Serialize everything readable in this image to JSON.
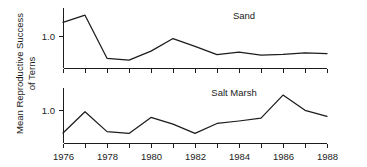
{
  "chart_data": {
    "type": "line",
    "title": "",
    "xlabel": "",
    "ylabel": "Mean Reproductive Success of Terns",
    "ylabel_line1": "Mean Reproductive Success",
    "ylabel_line2": "of Terns",
    "x": [
      1976,
      1977,
      1978,
      1979,
      1980,
      1981,
      1982,
      1983,
      1984,
      1985,
      1986,
      1987,
      1988
    ],
    "xlim": [
      1976,
      1988
    ],
    "xticks_major": [
      1976,
      1978,
      1980,
      1982,
      1984,
      1986,
      1988
    ],
    "xticklabels": [
      "1976",
      "1978",
      "1980",
      "1982",
      "1984",
      "1986",
      "1988"
    ],
    "xticks_minor": [
      1977,
      1979,
      1981,
      1983,
      1985,
      1987
    ],
    "grid": false,
    "legend": "none",
    "panels": [
      {
        "name": "sand",
        "label": "Sand",
        "yticks": [
          1.0
        ],
        "yticklabels": [
          "1.0"
        ],
        "ylim": [
          0.28,
          1.95
        ],
        "values": [
          1.55,
          1.75,
          0.55,
          0.5,
          0.75,
          1.1,
          0.88,
          0.65,
          0.72,
          0.64,
          0.66,
          0.7,
          0.68
        ]
      },
      {
        "name": "salt-marsh",
        "label": "Salt Marsh",
        "yticks": [
          1.0
        ],
        "yticklabels": [
          "1.0"
        ],
        "ylim": [
          0.3,
          1.85
        ],
        "values": [
          0.58,
          1.18,
          0.62,
          0.57,
          1.02,
          0.83,
          0.57,
          0.85,
          0.92,
          1.0,
          1.65,
          1.22,
          1.05
        ]
      }
    ]
  },
  "colors": {
    "ink": "#1c1c1c",
    "background": "#ffffff"
  }
}
